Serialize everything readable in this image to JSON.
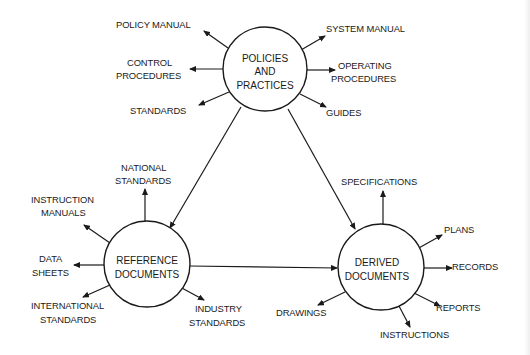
{
  "diagram": {
    "nodes": {
      "policies": {
        "lines": [
          "POLICIES",
          "AND",
          "PRACTICES"
        ],
        "outputs": {
          "policy_manual": [
            "POLICY MANUAL"
          ],
          "control_procedures": [
            "CONTROL",
            "PROCEDURES"
          ],
          "standards": [
            "STANDARDS"
          ],
          "system_manual": [
            "SYSTEM MANUAL"
          ],
          "operating_procedures": [
            "OPERATING",
            "PROCEDURES"
          ],
          "guides": [
            "GUIDES"
          ]
        }
      },
      "reference": {
        "lines": [
          "REFERENCE",
          "DOCUMENTS"
        ],
        "outputs": {
          "national_standards": [
            "NATIONAL",
            "STANDARDS"
          ],
          "instruction_manuals": [
            "INSTRUCTION",
            "MANUALS"
          ],
          "data_sheets": [
            "DATA",
            "SHEETS"
          ],
          "international_standards": [
            "INTERNATIONAL",
            "STANDARDS"
          ],
          "industry_standards": [
            "INDUSTRY",
            "STANDARDS"
          ]
        }
      },
      "derived": {
        "lines": [
          "DERIVED",
          "DOCUMENTS"
        ],
        "outputs": {
          "specifications": [
            "SPECIFICATIONS"
          ],
          "plans": [
            "PLANS"
          ],
          "records": [
            "RECORDS"
          ],
          "reports": [
            "REPORTS"
          ],
          "instructions": [
            "INSTRUCTIONS"
          ],
          "drawings": [
            "DRAWINGS"
          ]
        }
      }
    },
    "edges": [
      {
        "from": "POLICIES AND PRACTICES",
        "to": "REFERENCE DOCUMENTS"
      },
      {
        "from": "POLICIES AND PRACTICES",
        "to": "DERIVED DOCUMENTS"
      },
      {
        "from": "REFERENCE DOCUMENTS",
        "to": "DERIVED DOCUMENTS"
      }
    ],
    "colors": {
      "ink": "#1a1a1a",
      "background": "#ffffff"
    }
  }
}
